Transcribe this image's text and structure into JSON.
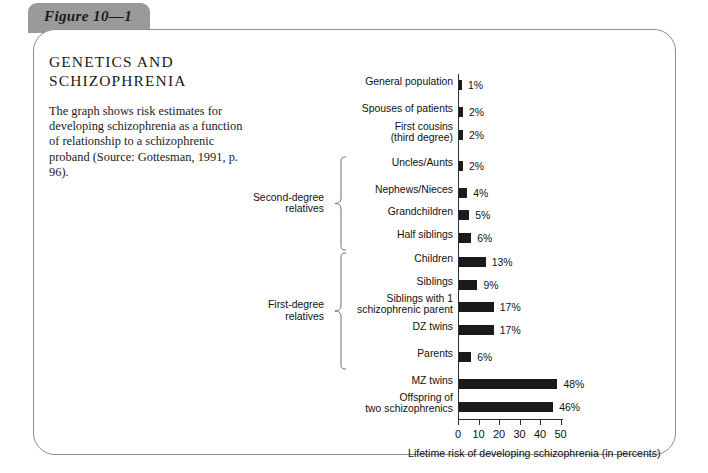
{
  "figure": {
    "tab_label": "Figure 10—1"
  },
  "copy": {
    "title": "GENETICS AND SCHIZOPHRENIA",
    "body": "The graph shows risk estimates for developing schizophrenia as a function of relationship to a schizophrenic proband (Source: Gottesman, 1991, p. 96)."
  },
  "brackets": [
    {
      "label": "Second-degree\nrelatives"
    },
    {
      "label": "First-degree\nrelatives"
    }
  ],
  "chart_data": {
    "type": "bar",
    "orientation": "horizontal",
    "title": "GENETICS AND SCHIZOPHRENIA",
    "xlabel": "Lifetime risk of developing schizophrenia (in percents)",
    "ylabel": "",
    "xlim": [
      0,
      50
    ],
    "xticks": [
      0,
      10,
      20,
      30,
      40,
      50
    ],
    "xtick_labels": [
      "0",
      "10",
      "20",
      "30",
      "40",
      "50"
    ],
    "grid": false,
    "legend": false,
    "bar_color": "#1b1b1b",
    "categories": [
      "General population",
      "Spouses of patients",
      "First cousins\n(third degree)",
      "Uncles/Aunts",
      "Nephews/Nieces",
      "Grandchildren",
      "Half siblings",
      "Children",
      "Siblings",
      "Siblings with 1\nschizophrenic parent",
      "DZ twins",
      "Parents",
      "MZ twins",
      "Offspring of\ntwo schizophrenics"
    ],
    "values": [
      1,
      2,
      2,
      2,
      4,
      5,
      6,
      13,
      9,
      17,
      17,
      6,
      48,
      46
    ],
    "value_labels": [
      "1%",
      "2%",
      "2%",
      "2%",
      "4%",
      "5%",
      "6%",
      "13%",
      "9%",
      "17%",
      "17%",
      "6%",
      "48%",
      "46%"
    ]
  }
}
